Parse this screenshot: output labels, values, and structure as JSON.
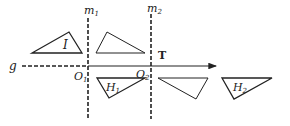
{
  "diagram": {
    "lines": {
      "m1": {
        "label": "m",
        "sub": "1"
      },
      "m2": {
        "label": "m",
        "sub": "2"
      },
      "g": {
        "label": "g"
      }
    },
    "points": {
      "O1": {
        "label": "O",
        "sub": "1"
      },
      "O2": {
        "label": "O",
        "sub": "2"
      }
    },
    "vector": {
      "label": "T"
    },
    "figures": {
      "I": {
        "label": "I"
      },
      "reflection_of_I": {
        "label": ""
      },
      "H1": {
        "label": "H",
        "sub": "1"
      },
      "reflection_of_H1": {
        "label": ""
      },
      "H2": {
        "label": "H",
        "sub": "2"
      }
    },
    "colors": {
      "ink": "#222222",
      "background": "#ffffff"
    }
  }
}
